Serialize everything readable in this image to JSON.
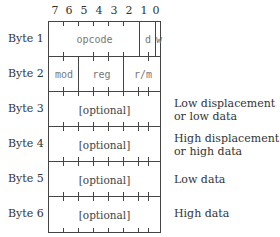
{
  "bit_numbers": [
    "7",
    "6",
    "5",
    "4",
    "3",
    "2",
    "1",
    "0"
  ],
  "rows": [
    {
      "label": "Byte 1",
      "fields": [
        {
          "name": "opcode"
        },
        {
          "name": "d"
        },
        {
          "name": "w"
        }
      ],
      "description": ""
    },
    {
      "label": "Byte 2",
      "fields": [
        {
          "name": "mod"
        },
        {
          "name": "reg"
        },
        {
          "name": "r/m"
        }
      ],
      "description": ""
    },
    {
      "label": "Byte 3",
      "content": "[optional]",
      "description_line1": "Low displacement",
      "description_line2": "or low data"
    },
    {
      "label": "Byte 4",
      "content": "[optional]",
      "description_line1": "High displacement",
      "description_line2": "or high data"
    },
    {
      "label": "Byte 5",
      "content": "[optional]",
      "description_line1": "Low data",
      "description_line2": ""
    },
    {
      "label": "Byte 6",
      "content": "[optional]",
      "description_line1": "High data",
      "description_line2": ""
    }
  ]
}
